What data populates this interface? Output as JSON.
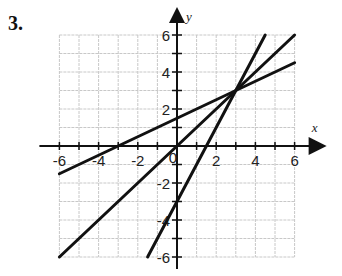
{
  "problem": {
    "number": "3."
  },
  "chart_data": {
    "type": "line",
    "title": "",
    "xlabel": "x",
    "ylabel": "y",
    "xlim": [
      -6,
      6
    ],
    "ylim": [
      -6,
      6
    ],
    "grid": true,
    "grid_step": 1,
    "x_tick_labels": [
      "-6",
      "-4",
      "-2",
      "2",
      "4",
      "6"
    ],
    "y_tick_labels": [
      "6",
      "4",
      "2",
      "-2",
      "-4",
      "-6"
    ],
    "origin_label": "0",
    "series": [
      {
        "name": "y = x",
        "points": [
          [
            -6,
            -6
          ],
          [
            6,
            6
          ]
        ]
      },
      {
        "name": "y = 2x - 3",
        "points": [
          [
            -1.5,
            -6
          ],
          [
            4.5,
            6
          ]
        ]
      },
      {
        "name": "y = 0.5x + 1.5",
        "points": [
          [
            -6,
            -1.5
          ],
          [
            6,
            4.5
          ]
        ]
      }
    ],
    "intersection": [
      3,
      3
    ],
    "annotations": []
  },
  "colors": {
    "grid": "#c8c8c8",
    "axis": "#111111",
    "line": "#111111"
  }
}
